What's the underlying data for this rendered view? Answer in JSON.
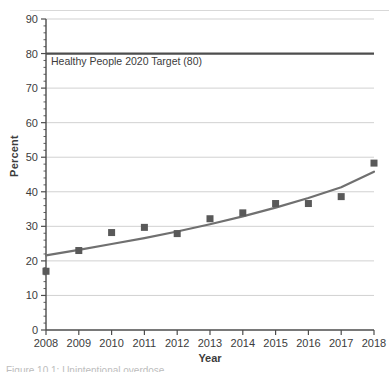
{
  "figure": {
    "ylabel": "Percent",
    "xlabel": "Year",
    "caption_partial": "Figure 10.1: Unintentional overdose…"
  },
  "annotations": {
    "target_line_label": "Healthy People 2020 Target (80)"
  },
  "colors": {
    "marker": "#595959",
    "trend_line": "#707070",
    "target_line": "#4d4d4d",
    "grid": "#cccccc",
    "axis": "#4d4d4d",
    "text": "#3c3c3c"
  },
  "chart_data": {
    "type": "scatter",
    "title": "",
    "xlabel": "Year",
    "ylabel": "Percent",
    "x": [
      2008,
      2009,
      2010,
      2011,
      2012,
      2013,
      2014,
      2015,
      2016,
      2017,
      2018
    ],
    "values": [
      17.0,
      23.0,
      28.2,
      29.7,
      27.9,
      32.2,
      33.9,
      36.6,
      36.6,
      38.6,
      48.3
    ],
    "xlim": [
      2008,
      2018
    ],
    "ylim": [
      0,
      90
    ],
    "ytick_step": 10,
    "yticks": [
      0,
      10,
      20,
      30,
      40,
      50,
      60,
      70,
      80,
      90
    ],
    "xticks": [
      2008,
      2009,
      2010,
      2011,
      2012,
      2013,
      2014,
      2015,
      2016,
      2017,
      2018
    ],
    "xtick_labels": [
      "2008",
      "2009",
      "2010",
      "2011",
      "2012",
      "2013",
      "2014",
      "2015",
      "2016",
      "2017",
      "2018"
    ],
    "ytick_labels": [
      "0",
      "10",
      "20",
      "30",
      "40",
      "50",
      "60",
      "70",
      "80",
      "90"
    ],
    "minor_ticks_y": true,
    "grid": "horizontal",
    "legend": "none",
    "series": [
      {
        "name": "Observed percent",
        "type": "scatter",
        "marker": "square",
        "values": [
          17.0,
          23.0,
          28.2,
          29.7,
          27.9,
          32.2,
          33.9,
          36.6,
          36.6,
          38.6,
          48.3
        ]
      },
      {
        "name": "Trend line",
        "type": "line",
        "values": [
          21.6,
          23.2,
          24.9,
          26.6,
          28.5,
          30.6,
          32.9,
          35.4,
          38.2,
          41.3,
          45.8
        ]
      }
    ],
    "reference_lines": [
      {
        "name": "Healthy People 2020 Target",
        "value": 80,
        "label": "Healthy People 2020 Target (80)"
      }
    ]
  }
}
